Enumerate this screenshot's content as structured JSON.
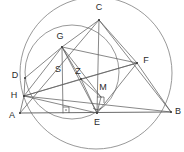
{
  "figure": {
    "width": 184,
    "height": 152,
    "background_color": "#ffffff",
    "stroke_color": "#606060",
    "arc_color": "#8d8d8d",
    "label_color": "#2b2b2b"
  },
  "points": {
    "A": {
      "label": "A",
      "x": 20,
      "y": 113,
      "label_x": 12,
      "label_y": 116
    },
    "B": {
      "label": "B",
      "x": 171,
      "y": 112,
      "label_x": 178,
      "label_y": 112
    },
    "C": {
      "label": "C",
      "x": 99,
      "y": 20,
      "label_x": 99,
      "label_y": 8
    },
    "D": {
      "label": "D",
      "x": 25,
      "y": 78,
      "label_x": 15,
      "label_y": 76
    },
    "E": {
      "label": "E",
      "x": 97,
      "y": 113,
      "label_x": 97,
      "label_y": 123
    },
    "F": {
      "label": "F",
      "x": 137,
      "y": 63,
      "label_x": 146,
      "label_y": 61
    },
    "G": {
      "label": "G",
      "x": 62,
      "y": 47,
      "label_x": 60,
      "label_y": 37
    },
    "H": {
      "label": "H",
      "x": 24,
      "y": 96,
      "label_x": 14,
      "label_y": 96
    },
    "M": {
      "label": "M",
      "x": 101,
      "y": 97,
      "label_x": 103,
      "label_y": 88
    },
    "S": {
      "label": "S",
      "x": 63,
      "y": 76,
      "label_x": 58,
      "label_y": 70
    },
    "Z": {
      "label": "Z",
      "x": 81,
      "y": 79,
      "label_x": 78,
      "label_y": 72
    }
  },
  "segments": [
    {
      "name": "A-B",
      "from": "A",
      "to": "B"
    },
    {
      "name": "A-C",
      "from": "A",
      "to": "C"
    },
    {
      "name": "B-C",
      "from": "B",
      "to": "C"
    },
    {
      "name": "C-G",
      "from": "C",
      "to": "G"
    },
    {
      "name": "C-E",
      "from": "C",
      "to": "E"
    },
    {
      "name": "C-F",
      "from": "C",
      "to": "F"
    },
    {
      "name": "G-F",
      "from": "G",
      "to": "F"
    },
    {
      "name": "G-H",
      "from": "G",
      "to": "H"
    },
    {
      "name": "G-D",
      "from": "G",
      "to": "D"
    },
    {
      "name": "G-S",
      "from": "G",
      "to": "S"
    },
    {
      "name": "G-Z",
      "from": "G",
      "to": "Z"
    },
    {
      "name": "G-E",
      "from": "G",
      "to": "E"
    },
    {
      "name": "G-M",
      "from": "G",
      "to": "M"
    },
    {
      "name": "H-D",
      "from": "H",
      "to": "D"
    },
    {
      "name": "H-A",
      "from": "H",
      "to": "A"
    },
    {
      "name": "H-Z",
      "from": "H",
      "to": "Z"
    },
    {
      "name": "H-F",
      "from": "H",
      "to": "F"
    },
    {
      "name": "H-E",
      "from": "H",
      "to": "E"
    },
    {
      "name": "H-B",
      "from": "H",
      "to": "B"
    },
    {
      "name": "Z-F",
      "from": "Z",
      "to": "F"
    },
    {
      "name": "Z-M",
      "from": "Z",
      "to": "M"
    },
    {
      "name": "Z-E",
      "from": "Z",
      "to": "E"
    },
    {
      "name": "M-E",
      "from": "M",
      "to": "E"
    },
    {
      "name": "F-E",
      "from": "F",
      "to": "E"
    },
    {
      "name": "F-B",
      "from": "F",
      "to": "B"
    },
    {
      "name": "S-base",
      "from": "S",
      "to": "S_foot"
    }
  ],
  "circles": [
    {
      "name": "circumcircle-ABC",
      "cx": 96,
      "cy": 73,
      "r": 76
    },
    {
      "name": "circle-through-D-G",
      "cx": 72,
      "cy": 72,
      "r": 47
    }
  ],
  "markers": [
    {
      "name": "right-angle-at-foot-of-S",
      "type": "right-angle",
      "x": 63,
      "y": 113
    },
    {
      "name": "right-angle-at-M",
      "type": "right-angle",
      "x": 101,
      "y": 103
    },
    {
      "name": "angle-arc-at-E",
      "type": "arc",
      "x": 97,
      "y": 113
    }
  ],
  "labels_order": [
    "C",
    "G",
    "F",
    "D",
    "S",
    "Z",
    "M",
    "H",
    "A",
    "E",
    "B"
  ]
}
